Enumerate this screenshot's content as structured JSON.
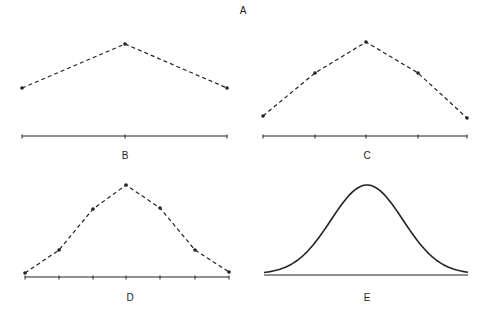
{
  "figure": {
    "title": "A",
    "panels": [
      {
        "id": "B",
        "label": "B",
        "style": "dashed-with-points",
        "points": [
          [
            22,
            88
          ],
          [
            125,
            44
          ],
          [
            227,
            88
          ]
        ],
        "axis": {
          "x1": 22,
          "x2": 227,
          "y": 136,
          "ticks": [
            22,
            125,
            227
          ]
        },
        "label_pos": [
          125,
          151
        ]
      },
      {
        "id": "C",
        "label": "C",
        "style": "dashed-with-points",
        "points": [
          [
            263,
            116
          ],
          [
            315,
            73
          ],
          [
            366,
            42
          ],
          [
            418,
            73
          ],
          [
            467,
            118
          ]
        ],
        "axis": {
          "x1": 263,
          "x2": 467,
          "y": 136,
          "ticks": [
            263,
            315,
            366,
            418,
            467
          ]
        },
        "label_pos": [
          367,
          151
        ]
      },
      {
        "id": "D",
        "label": "D",
        "style": "dashed-with-points",
        "points": [
          [
            25,
            273
          ],
          [
            59,
            250
          ],
          [
            93,
            209
          ],
          [
            126,
            185
          ],
          [
            160,
            208
          ],
          [
            195,
            250
          ],
          [
            229,
            272
          ]
        ],
        "axis": {
          "x1": 25,
          "x2": 229,
          "y": 277,
          "ticks": [
            25,
            59,
            93,
            126,
            160,
            195,
            229
          ]
        },
        "label_pos": [
          130,
          293
        ]
      },
      {
        "id": "E",
        "label": "E",
        "style": "smooth-curve",
        "curve": {
          "x_start": 264,
          "x_end": 468,
          "peak_x": 367,
          "peak_y": 185,
          "base_y": 274,
          "sigma_px": 36
        },
        "axis": {
          "x1": 264,
          "x2": 468,
          "y": 275,
          "ticks": []
        },
        "label_pos": [
          367,
          293
        ]
      }
    ]
  },
  "chart_data": {
    "type": "line",
    "title": "A",
    "series": [
      {
        "name": "B",
        "x": [
          1,
          2,
          3
        ],
        "values": [
          1,
          2,
          1
        ]
      },
      {
        "name": "C",
        "x": [
          1,
          2,
          3,
          4,
          5
        ],
        "values": [
          1,
          2,
          3,
          2,
          1
        ]
      },
      {
        "name": "D",
        "x": [
          1,
          2,
          3,
          4,
          5,
          6,
          7
        ],
        "values": [
          0.1,
          0.28,
          0.74,
          1.0,
          0.76,
          0.28,
          0.1
        ]
      },
      {
        "name": "E",
        "curve": "normal (bell-shaped) smooth curve"
      }
    ],
    "grid": false,
    "legend": "none"
  },
  "colors": {
    "line": "#222222",
    "background": "#ffffff"
  }
}
